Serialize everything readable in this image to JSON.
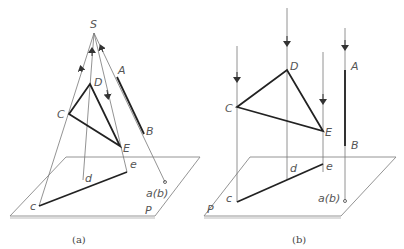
{
  "figure": {
    "panel_a": {
      "caption": "(a)",
      "projection_center": "S",
      "points": {
        "C": "C",
        "D": "D",
        "E": "E",
        "A": "A",
        "B": "B"
      },
      "projections": {
        "c": "c",
        "d": "d",
        "e": "e",
        "ab": "a(b)"
      },
      "plane": "P"
    },
    "panel_b": {
      "caption": "(b)",
      "points": {
        "C": "C",
        "D": "D",
        "E": "E",
        "A": "A",
        "B": "B"
      },
      "projections": {
        "c": "c",
        "d": "d",
        "e": "e",
        "ab": "a(b)"
      },
      "plane": "P"
    }
  }
}
